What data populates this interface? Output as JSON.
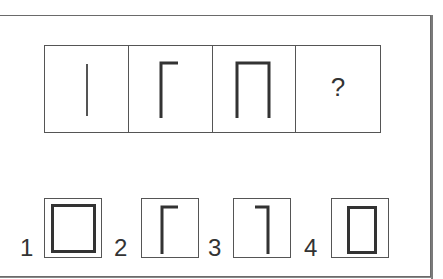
{
  "puzzle": {
    "sequence": [
      {
        "figure": "single-vertical-line"
      },
      {
        "figure": "gamma-shape-line-with-top-right-arm"
      },
      {
        "figure": "pi-shape-three-sides"
      },
      {
        "figure": "unknown",
        "label": "?"
      }
    ],
    "options": [
      {
        "label": "1",
        "figure": "closed-square"
      },
      {
        "label": "2",
        "figure": "gamma-shape-line-with-top-right-arm"
      },
      {
        "label": "3",
        "figure": "reverse-gamma-shape-line-with-top-left-arm"
      },
      {
        "label": "4",
        "figure": "closed-tall-rectangle"
      }
    ]
  },
  "colors": {
    "stroke": "#333333",
    "thin_stroke": "#555555",
    "border": "#555555",
    "background": "#ffffff"
  }
}
